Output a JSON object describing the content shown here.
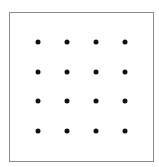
{
  "diagram": {
    "type": "dot-grid",
    "rows": 4,
    "cols": 4,
    "dot_color": "#111111",
    "border_color": "#8a8a8a",
    "col_positions": [
      38,
      67,
      96,
      125
    ],
    "row_positions": [
      42,
      72,
      101,
      131
    ]
  }
}
